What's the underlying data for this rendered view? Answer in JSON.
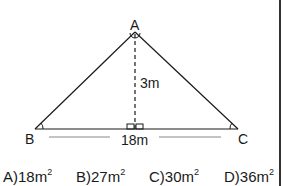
{
  "diagram": {
    "vertices": {
      "A": {
        "label": "A"
      },
      "B": {
        "label": "B"
      },
      "C": {
        "label": "C"
      }
    },
    "height_label": "3m",
    "base_label": "18m"
  },
  "options": [
    {
      "letter": "A)",
      "value": "18m",
      "exp": "2"
    },
    {
      "letter": "B)",
      "value": "27m",
      "exp": "2"
    },
    {
      "letter": "C)",
      "value": "30m",
      "exp": "2"
    },
    {
      "letter": "D)",
      "value": "36m",
      "exp": "2"
    }
  ],
  "colors": {
    "line": "#1a1a1a",
    "border": "#333333",
    "background": "#ffffff"
  }
}
